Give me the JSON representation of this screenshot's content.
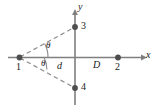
{
  "figure": {
    "type": "geometry-diagram",
    "colors": {
      "axis": "#7f7f7f",
      "dashed_line": "#8c8c8c",
      "point": "#4d4d4d",
      "text": "#1a1a1a",
      "background": "#ffffff"
    },
    "axes": {
      "x_label": "x",
      "y_label": "y"
    },
    "points": [
      {
        "id": "p1",
        "label": "1",
        "x": 19,
        "y": 57,
        "on": "x-axis",
        "label_pos": "below"
      },
      {
        "id": "p2",
        "label": "2",
        "x": 118,
        "y": 57,
        "on": "x-axis",
        "label_pos": "below"
      },
      {
        "id": "p3",
        "label": "3",
        "x": 75,
        "y": 27,
        "on": "y-axis",
        "label_pos": "right"
      },
      {
        "id": "p4",
        "label": "4",
        "x": 75,
        "y": 88,
        "on": "y-axis",
        "label_pos": "right"
      }
    ],
    "distances": [
      {
        "id": "d",
        "label": "d",
        "from": "p1",
        "to": "origin"
      },
      {
        "id": "D",
        "label": "D",
        "from": "origin",
        "to": "p2"
      }
    ],
    "angles": [
      {
        "id": "theta-upper",
        "label": "θ",
        "vertex": "p1",
        "between": [
          "x-axis",
          "p1-p3"
        ]
      },
      {
        "id": "theta-lower",
        "label": "θ",
        "vertex": "p1",
        "between": [
          "x-axis",
          "p1-p4"
        ]
      }
    ],
    "dashed_segments": [
      {
        "id": "seg-1-3",
        "from": "p1",
        "to": "p3"
      },
      {
        "id": "seg-1-4",
        "from": "p1",
        "to": "p4"
      }
    ]
  }
}
